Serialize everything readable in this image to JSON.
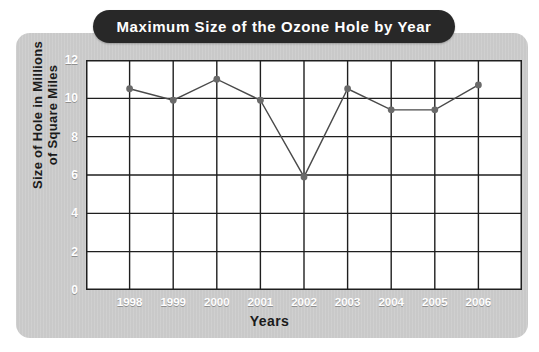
{
  "chart_data": {
    "type": "line",
    "title": "Maximum Size of the Ozone Hole by Year",
    "xlabel": "Years",
    "ylabel": "Size of Hole in Millions of Square Miles",
    "ylabel_line1": "Size of Hole in Millions",
    "ylabel_line2": "of Square Miles",
    "categories": [
      "1998",
      "1999",
      "2000",
      "2001",
      "2002",
      "2003",
      "2004",
      "2005",
      "2006"
    ],
    "values": [
      10.5,
      9.9,
      11.0,
      9.9,
      5.9,
      10.5,
      9.4,
      9.4,
      10.7
    ],
    "yticks": [
      "12",
      "10",
      "8",
      "6",
      "4",
      "2",
      "0"
    ],
    "ytick_values": [
      12,
      10,
      8,
      6,
      4,
      2,
      0
    ],
    "ylim": [
      0,
      12
    ],
    "grid": true,
    "legend": "none",
    "series": [
      {
        "name": "Maximum ozone hole size",
        "values": [
          10.5,
          9.9,
          11.0,
          9.9,
          5.9,
          10.5,
          9.4,
          9.4,
          10.7
        ]
      }
    ]
  },
  "style": {
    "panel_bg": "#c9c9c9",
    "plot_bg": "#ffffff",
    "title_pill_bg": "#282828",
    "title_text_color": "#ffffff",
    "tick_label_color": "#ffffff",
    "axis_title_color": "#1b1b1b",
    "line_color": "#4a4a4a",
    "marker_color": "#6a6a6a",
    "grid_color": "#1f1f1f"
  }
}
